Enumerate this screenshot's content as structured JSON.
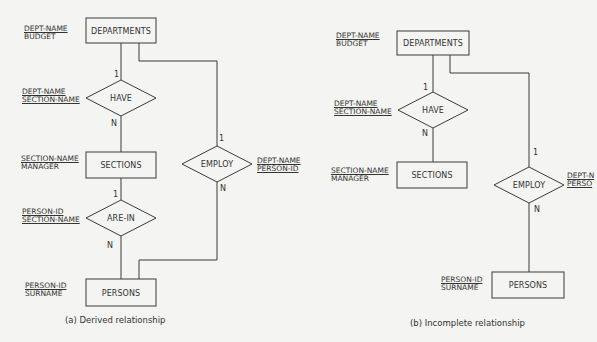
{
  "diagrams": [
    {
      "id": "a",
      "caption": "(a)  Derived relationship",
      "entities": {
        "departments": {
          "label": "DEPARTMENTS",
          "key_attr": "DEPT-NAME",
          "attrs": [
            "BUDGET"
          ]
        },
        "sections": {
          "label": "SECTIONS",
          "key_attr": "SECTION-NAME",
          "attrs": [
            "MANAGER"
          ]
        },
        "persons": {
          "label": "PERSONS",
          "key_attr": "PERSON-ID",
          "attrs": [
            "SURNAME"
          ]
        }
      },
      "relationships": {
        "have": {
          "label": "HAVE",
          "keys": [
            "DEPT-NAME",
            "SECTION-NAME"
          ],
          "card_top": "1",
          "card_bottom": "N"
        },
        "are_in": {
          "label": "ARE-IN",
          "keys": [
            "PERSON-ID",
            "SECTION-NAME"
          ],
          "card_top": "1",
          "card_bottom": "N"
        },
        "employ": {
          "label": "EMPLOY",
          "keys": [
            "DEPT-NAME",
            "PERSON-ID"
          ],
          "card_top": "1",
          "card_bottom": "N"
        }
      }
    },
    {
      "id": "b",
      "caption": "(b) Incomplete relationship",
      "entities": {
        "departments": {
          "label": "DEPARTMENTS",
          "key_attr": "DEPT-NAME",
          "attrs": [
            "BUDGET"
          ]
        },
        "sections": {
          "label": "SECTIONS",
          "key_attr": "SECTION-NAME",
          "attrs": [
            "MANAGER"
          ]
        },
        "persons": {
          "label": "PERSONS",
          "key_attr": "PERSON-ID",
          "attrs": [
            "SURNAME"
          ]
        }
      },
      "relationships": {
        "have": {
          "label": "HAVE",
          "keys": [
            "DEPT-NAME",
            "SECTION-NAME"
          ],
          "card_top": "1",
          "card_bottom": "N"
        },
        "employ": {
          "label": "EMPLOY",
          "keys": [
            "DEPT-N",
            "PERSO"
          ],
          "card_top": "1",
          "card_bottom": "N"
        }
      }
    }
  ],
  "colors": {
    "background": "#f4f4f2",
    "line": "#3a3a3a",
    "text": "#333333"
  }
}
